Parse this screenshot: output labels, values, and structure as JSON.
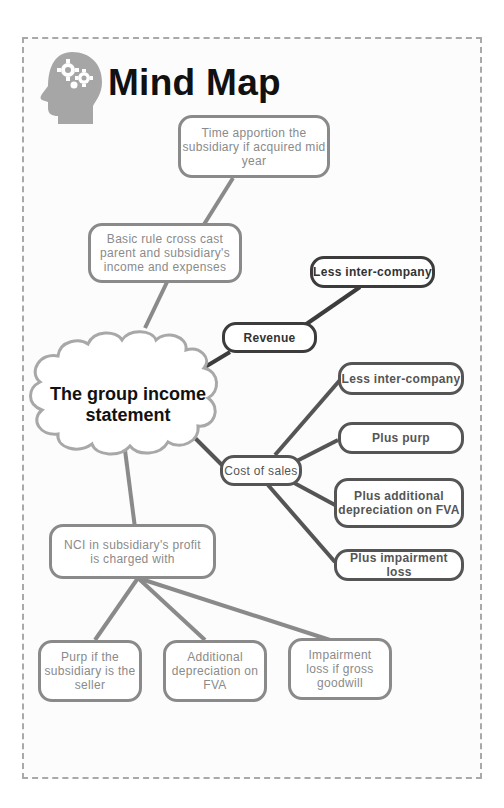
{
  "header": {
    "title": "Mind Map",
    "icon": "head-gears-icon"
  },
  "central": {
    "label": "The group income statement"
  },
  "colors": {
    "frame": "#a9a9a9",
    "grey_branch": "#8a8a8a",
    "dark_branch": "#3c3c3c",
    "cost_branch": "#555555",
    "cloud": "#a8a8a8"
  },
  "nodes": {
    "time_apportion": "Time apportion the subsidiary if acquired mid year",
    "basic_rule": "Basic rule cross cast parent and subsidiary's income and expenses",
    "revenue": "Revenue",
    "revenue_less": "Less inter-company",
    "cost_of_sales": "Cost of sales",
    "cos_less": "Less inter-company",
    "cos_purp": "Plus purp",
    "cos_depr": "Plus additional depreciation on FVA",
    "cos_impair": "Plus impairment loss",
    "nci": "NCI in subsidiary's profit is charged with",
    "nci_purp": "Purp if the subsidiary is the seller",
    "nci_depr": "Additional depreciation on FVA",
    "nci_impair": "Impairment loss if gross goodwill"
  }
}
